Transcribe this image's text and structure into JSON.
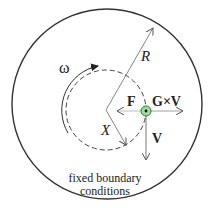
{
  "diagram": {
    "labels": {
      "radius": "R",
      "omega": "ω",
      "force": "F",
      "cross": "G×V",
      "velocity": "V",
      "position": "X"
    },
    "caption_line1": "fixed boundary",
    "caption_line2": "conditions",
    "colors": {
      "stroke": "#333333",
      "arrow_light": "#999999",
      "particle_fill": "#8fd18f",
      "particle_ring": "#2e7d32"
    }
  }
}
